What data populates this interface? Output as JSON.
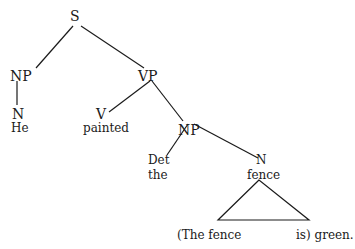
{
  "tree": {
    "root": "S",
    "nodes": {
      "s": "S",
      "np1": "NP",
      "vp": "VP",
      "n1": "N",
      "he": "He",
      "v": "V",
      "painted": "painted",
      "np2": "NP",
      "det": "Det",
      "the": "the",
      "n2": "N",
      "fence": "fence",
      "clause_left": "(The fence",
      "clause_right": "is) green."
    },
    "edges": [
      [
        "S",
        "NP"
      ],
      [
        "S",
        "VP"
      ],
      [
        "NP",
        "N"
      ],
      [
        "VP",
        "V"
      ],
      [
        "VP",
        "NP"
      ],
      [
        "NP",
        "Det"
      ],
      [
        "NP",
        "N"
      ],
      [
        "N",
        "triangle"
      ]
    ]
  }
}
